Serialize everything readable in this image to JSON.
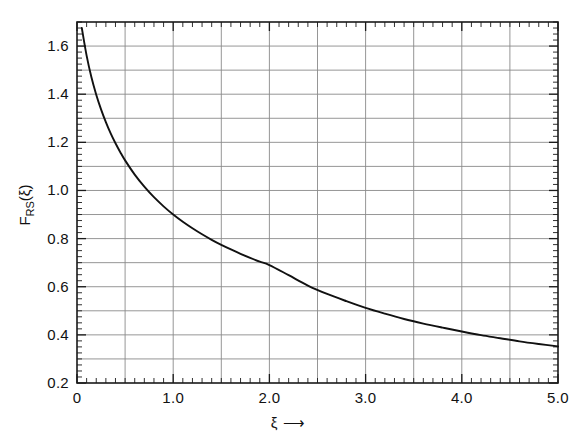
{
  "figure": {
    "background": "#ffffff",
    "ink_color": "#1a1a1a",
    "grid_color": "#8a8a8a",
    "curve_color": "#111111"
  },
  "axis_titles": {
    "y_main": "F",
    "y_sub": "RS",
    "y_arg": "(ξ)",
    "x_symbol": "ξ",
    "x_arrow": "⟶"
  },
  "chart_data": {
    "type": "line",
    "title": "",
    "xlabel": "ξ ⟶",
    "ylabel": "F_RS(ξ)",
    "xlim": [
      0,
      5.0
    ],
    "ylim": [
      0.2,
      1.7
    ],
    "grid": true,
    "legend": "none",
    "x_ticks_major": [
      0,
      1.0,
      2.0,
      3.0,
      4.0,
      5.0
    ],
    "x_tick_labels": [
      "0",
      "1.0",
      "2.0",
      "3.0",
      "4.0",
      "5.0"
    ],
    "x_ticks_minor_step": 0.1,
    "y_ticks_major": [
      0.2,
      0.4,
      0.6,
      0.8,
      1.0,
      1.2,
      1.4,
      1.6
    ],
    "y_tick_labels": [
      "0.2",
      "0.4",
      "0.6",
      "0.8",
      "1.0",
      "1.2",
      "1.4",
      "1.6"
    ],
    "y_gridlines": [
      0.3,
      0.4,
      0.5,
      0.6,
      0.7,
      0.8,
      0.9,
      1.0,
      1.1,
      1.2,
      1.3,
      1.4,
      1.5,
      1.6
    ],
    "x_gridlines": [
      0.5,
      1.0,
      1.5,
      2.0,
      2.5,
      3.0,
      3.5,
      4.0,
      4.5
    ],
    "y_ticks_minor_step": 0.025,
    "series": [
      {
        "name": "F_RS",
        "x": [
          0.05,
          0.1,
          0.15,
          0.2,
          0.25,
          0.3,
          0.35,
          0.4,
          0.45,
          0.5,
          0.6,
          0.7,
          0.8,
          0.9,
          1.0,
          1.1,
          1.2,
          1.3,
          1.4,
          1.5,
          1.6,
          1.7,
          1.8,
          1.9,
          2.0,
          2.2,
          2.4,
          2.6,
          2.8,
          3.0,
          3.2,
          3.4,
          3.6,
          3.8,
          4.0,
          4.2,
          4.4,
          4.6,
          4.8,
          5.0
        ],
        "y": [
          1.675,
          1.56,
          1.47,
          1.398,
          1.337,
          1.284,
          1.237,
          1.196,
          1.159,
          1.125,
          1.066,
          1.016,
          0.972,
          0.934,
          0.9,
          0.87,
          0.843,
          0.818,
          0.795,
          0.774,
          0.755,
          0.737,
          0.72,
          0.704,
          0.69,
          0.648,
          0.605,
          0.57,
          0.54,
          0.512,
          0.488,
          0.466,
          0.447,
          0.43,
          0.414,
          0.399,
          0.386,
          0.373,
          0.362,
          0.352
        ]
      }
    ]
  }
}
